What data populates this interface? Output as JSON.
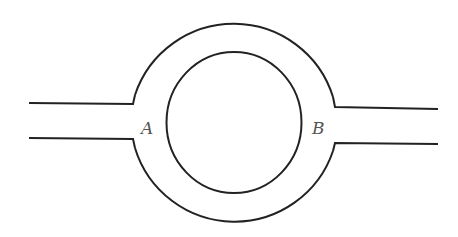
{
  "diagram": {
    "labels": {
      "a": "A",
      "b": "B"
    },
    "colors": {
      "stroke": "#222222",
      "label": "#555555",
      "background": "#ffffff"
    }
  }
}
